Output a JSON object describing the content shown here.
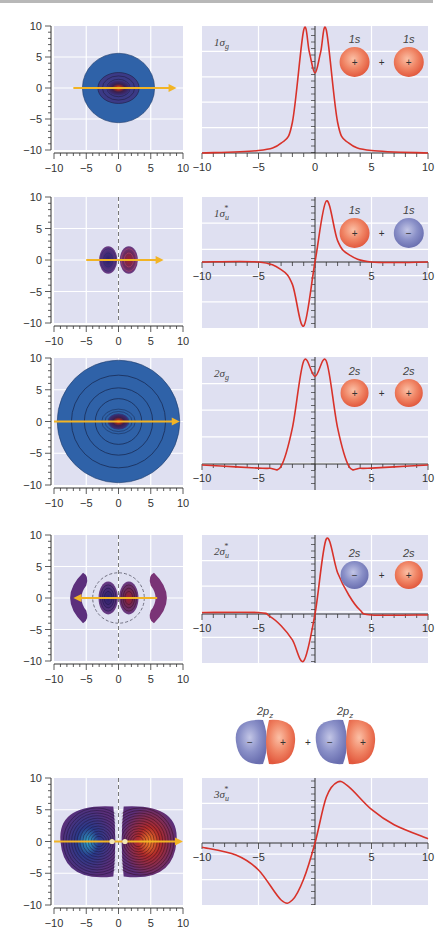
{
  "colors": {
    "plot_bg": "#dfe0f1",
    "grid": "#ffffff",
    "curve": "#d8322a",
    "arrow": "#f2b425",
    "contour_outer_blue": "#2f62a8",
    "lobe_purple": "#6a3a80",
    "plus_orbital": "#ee7a5e",
    "minus_orbital": "#7d84c0"
  },
  "axis_ticks": [
    "−10",
    "−5",
    "0",
    "5",
    "10"
  ],
  "panels": [
    {
      "mo_label": "1σg",
      "mo_main": "1σ",
      "mo_sub": "g",
      "mo_sup": "",
      "ao_labels": [
        "1s",
        "1s"
      ],
      "ao_signs": [
        "+",
        "+"
      ],
      "combiner": "+"
    },
    {
      "mo_label": "1σu*",
      "mo_main": "1σ",
      "mo_sub": "u",
      "mo_sup": "*",
      "ao_labels": [
        "1s",
        "1s"
      ],
      "ao_signs": [
        "+",
        "−"
      ],
      "combiner": "+"
    },
    {
      "mo_label": "2σg",
      "mo_main": "2σ",
      "mo_sub": "g",
      "mo_sup": "",
      "ao_labels": [
        "2s",
        "2s"
      ],
      "ao_signs": [
        "+",
        "+"
      ],
      "combiner": "+"
    },
    {
      "mo_label": "2σu*",
      "mo_main": "2σ",
      "mo_sub": "u",
      "mo_sup": "*",
      "ao_labels": [
        "2s",
        "2s"
      ],
      "ao_signs": [
        "−",
        "+"
      ],
      "combiner": "+"
    },
    {
      "mo_label": "3σu*",
      "mo_main": "3σ",
      "mo_sub": "u",
      "mo_sup": "*",
      "ao_labels": [
        "2pz",
        "2pz"
      ],
      "ao_label_main": "2p",
      "ao_label_sub": "z",
      "ao_signs": [
        "−",
        "+",
        "−",
        "+"
      ],
      "combiner": "+"
    }
  ],
  "chart_data": [
    {
      "type": "heatmap",
      "title": "1σg contour",
      "xlim": [
        -10,
        10
      ],
      "ylim": [
        -10,
        10
      ],
      "xticks": [
        -10,
        -5,
        0,
        5,
        10
      ],
      "yticks": [
        -10,
        -5,
        0,
        5,
        10
      ],
      "description": "single circular lobe radius ~5.5 centered at origin, dark red core",
      "arrow": "from x=-7 to x=9 along y=0"
    },
    {
      "type": "line",
      "title": "1σg",
      "x": [
        -10,
        -5,
        -3,
        -2,
        -1,
        -0.5,
        0,
        0.5,
        1,
        2,
        3,
        5,
        10
      ],
      "y": [
        0,
        0.02,
        0.08,
        0.25,
        1.0,
        0.82,
        0.65,
        0.82,
        1.0,
        0.25,
        0.08,
        0.02,
        0
      ],
      "xlim": [
        -10,
        10
      ],
      "xticks": [
        -10,
        -5,
        0,
        5,
        10
      ],
      "grid": true
    },
    {
      "type": "heatmap",
      "title": "1σu* contour",
      "xlim": [
        -10,
        10
      ],
      "ylim": [
        -10,
        10
      ],
      "xticks": [
        -10,
        -5,
        0,
        5,
        10
      ],
      "yticks": [
        -10,
        -5,
        0,
        5,
        10
      ],
      "description": "two small lobes at x=±1.5, nodal plane at x=0",
      "arrow": "from x=-5 to x=7 along y=0"
    },
    {
      "type": "line",
      "title": "1σu*",
      "x": [
        -10,
        -5,
        -3,
        -2,
        -1,
        0,
        1,
        2,
        3,
        5,
        10
      ],
      "y": [
        0,
        0,
        -0.12,
        -0.35,
        -1.0,
        0,
        1.0,
        0.35,
        0.12,
        0,
        0
      ],
      "xlim": [
        -10,
        10
      ],
      "xticks": [
        -10,
        -5,
        0,
        5,
        10
      ],
      "grid": true
    },
    {
      "type": "heatmap",
      "title": "2σg contour",
      "xlim": [
        -10,
        10
      ],
      "ylim": [
        -10,
        10
      ],
      "xticks": [
        -10,
        -5,
        0,
        5,
        10
      ],
      "yticks": [
        -10,
        -5,
        0,
        5,
        10
      ],
      "description": "large circular lobe radius ~9.5, concentric contours, red core",
      "arrow": "from x=-10 to x=9.5 along y=0"
    },
    {
      "type": "line",
      "title": "2σg",
      "x": [
        -10,
        -7,
        -5,
        -4,
        -3,
        -2,
        -1,
        0,
        1,
        2,
        3,
        4,
        5,
        7,
        10
      ],
      "y": [
        -0.04,
        -0.12,
        -0.17,
        -0.18,
        -0.1,
        0.35,
        1.0,
        0.85,
        1.0,
        0.35,
        -0.1,
        -0.18,
        -0.17,
        -0.12,
        -0.04
      ],
      "xlim": [
        -10,
        10
      ],
      "xticks": [
        -10,
        -5,
        0,
        5,
        10
      ],
      "grid": true
    },
    {
      "type": "heatmap",
      "title": "2σu* contour",
      "xlim": [
        -10,
        10
      ],
      "ylim": [
        -10,
        10
      ],
      "xticks": [
        -10,
        -5,
        0,
        5,
        10
      ],
      "yticks": [
        -10,
        -5,
        0,
        5,
        10
      ],
      "description": "inner pair of lobes x=±1.5, dashed nodal circle r≈4, outer crescent lobes x≈±7",
      "arrow": "from x=6 to x=-7 along y=0"
    },
    {
      "type": "line",
      "title": "2σu*",
      "x": [
        -10,
        -5,
        -4,
        -3,
        -2,
        -1,
        0,
        1,
        2,
        3,
        4,
        5,
        10
      ],
      "y": [
        0.02,
        0.02,
        -0.05,
        -0.25,
        -0.55,
        -1.0,
        0,
        1.0,
        0.55,
        0.25,
        0.05,
        -0.02,
        -0.02
      ],
      "xlim": [
        -10,
        10
      ],
      "xticks": [
        -10,
        -5,
        0,
        5,
        10
      ],
      "grid": true
    },
    {
      "type": "heatmap",
      "title": "3σu* contour",
      "xlim": [
        -10,
        10
      ],
      "ylim": [
        -10,
        10
      ],
      "xticks": [
        -10,
        -5,
        0,
        5,
        10
      ],
      "yticks": [
        -10,
        -5,
        0,
        5,
        10
      ],
      "description": "two large lobes centered at x=±3, radius ~6, blue left core, red right core",
      "arrow": "from x=-10 to x=10 along y=0, nuclei at x=±1"
    },
    {
      "type": "line",
      "title": "3σu*",
      "x": [
        -10,
        -7,
        -5,
        -3,
        -2,
        -1,
        0,
        1,
        2,
        3,
        5,
        7,
        10
      ],
      "y": [
        -0.07,
        -0.2,
        -0.45,
        -0.95,
        -0.95,
        -0.6,
        0,
        0.75,
        1.0,
        0.92,
        0.55,
        0.3,
        0.07
      ],
      "xlim": [
        -10,
        10
      ],
      "xticks": [
        -10,
        -5,
        0,
        5,
        10
      ],
      "grid": true
    }
  ]
}
